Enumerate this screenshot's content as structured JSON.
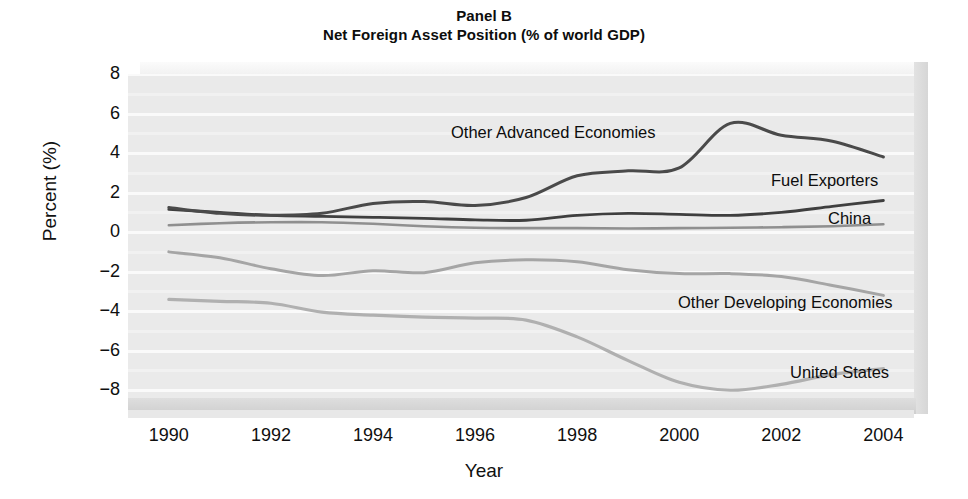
{
  "chart_data": {
    "type": "line",
    "title": "Panel B",
    "subtitle": "Net Foreign Asset Position (% of world GDP)",
    "xlabel": "Year",
    "ylabel": "Percent (%)",
    "xlim": [
      1989.2,
      2004.6
    ],
    "ylim": [
      -9.0,
      8.0
    ],
    "yticks": [
      8,
      6,
      4,
      2,
      0,
      -2,
      -4,
      -6,
      -8
    ],
    "ytick_labels": [
      "8",
      "6",
      "4",
      "2",
      "0",
      "−2",
      "−4",
      "−6",
      "−8"
    ],
    "xticks": [
      1990,
      1992,
      1994,
      1996,
      1998,
      2000,
      2002,
      2004
    ],
    "xtick_labels": [
      "1990",
      "1992",
      "1994",
      "1996",
      "1998",
      "2000",
      "2002",
      "2004"
    ],
    "grid": true,
    "grid_axis": "y",
    "legend_position": "inline-annotations",
    "plot_background": "#eaeaea",
    "gridline_color": "#fafafa",
    "x": [
      1990,
      1991,
      1992,
      1993,
      1994,
      1995,
      1996,
      1997,
      1998,
      1999,
      2000,
      2001,
      2002,
      2003,
      2004
    ],
    "series": [
      {
        "name": "Other Advanced Economies",
        "color": "#4a4a4a",
        "width": 3.0,
        "values": [
          1.25,
          0.95,
          0.85,
          0.95,
          1.45,
          1.55,
          1.35,
          1.75,
          2.85,
          3.1,
          3.25,
          5.5,
          4.9,
          4.6,
          3.8
        ]
      },
      {
        "name": "Fuel Exporters",
        "color": "#3f3f3f",
        "width": 2.8,
        "values": [
          1.15,
          1.0,
          0.85,
          0.8,
          0.75,
          0.7,
          0.62,
          0.6,
          0.85,
          0.95,
          0.9,
          0.85,
          1.0,
          1.3,
          1.6
        ]
      },
      {
        "name": "China",
        "color": "#8f8f8f",
        "width": 2.6,
        "values": [
          0.35,
          0.45,
          0.5,
          0.5,
          0.42,
          0.3,
          0.22,
          0.2,
          0.2,
          0.18,
          0.2,
          0.22,
          0.25,
          0.3,
          0.4
        ]
      },
      {
        "name": "Other Developing Economies",
        "color": "#a5a5a5",
        "width": 3.0,
        "values": [
          -1.0,
          -1.3,
          -1.85,
          -2.2,
          -1.95,
          -2.05,
          -1.55,
          -1.4,
          -1.5,
          -1.9,
          -2.1,
          -2.1,
          -2.25,
          -2.7,
          -3.2
        ]
      },
      {
        "name": "United States",
        "color": "#b0b0b0",
        "width": 3.2,
        "values": [
          -3.4,
          -3.5,
          -3.6,
          -4.05,
          -4.2,
          -4.3,
          -4.35,
          -4.45,
          -4.6,
          -4.6,
          -4.7,
          -4.8,
          -4.85,
          -4.85,
          -4.9
        ]
      }
    ],
    "us_override": {
      "name": "United States",
      "note": "United States curve drawn with its own path; values listed under series index 4 are Other Developing Economies floor in lower band",
      "values": [
        -3.4,
        -3.5,
        -3.6,
        -4.05,
        -4.2,
        -4.3,
        -4.35,
        -4.45,
        -5.3,
        -6.5,
        -7.6,
        -8.0,
        -7.7,
        -7.2,
        -6.9
      ]
    },
    "annotations": [
      {
        "text": "Other Advanced Economies",
        "x": 451,
        "y": 124
      },
      {
        "text": "Fuel Exporters",
        "x": 771,
        "y": 172
      },
      {
        "text": "China",
        "x": 828,
        "y": 210
      },
      {
        "text": "Other Developing Economies",
        "x": 678,
        "y": 294
      },
      {
        "text": "United States",
        "x": 790,
        "y": 364
      }
    ]
  }
}
